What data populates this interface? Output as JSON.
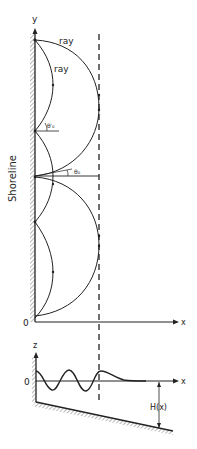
{
  "figure": {
    "top_panel": {
      "y_axis_label": "y",
      "x_axis_label": "x",
      "origin_label": "0",
      "shoreline_label": "Shoreline",
      "ray_labels": [
        "ray",
        "ray"
      ],
      "angle_labels": [
        "θ′₀",
        "θ₀"
      ]
    },
    "bottom_panel": {
      "z_axis_label": "z",
      "x_axis_label": "x",
      "zero_label": "0",
      "depth_label": "H(x)"
    },
    "colors": {
      "line": "#222222",
      "hatch": "#9a9a9a",
      "background": "#ffffff"
    }
  }
}
